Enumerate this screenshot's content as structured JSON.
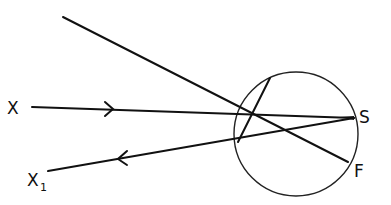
{
  "diagram": {
    "labels": {
      "x": "X",
      "x1_main": "X",
      "x1_sub": "1",
      "s": "S",
      "f": "F"
    },
    "colors": {
      "stroke": "#111111",
      "background": "#ffffff"
    },
    "geometry": {
      "circle": {
        "cx": 296,
        "cy": 134,
        "r": 62
      },
      "ray_in": {
        "from": [
          32,
          107
        ],
        "to": [
          354,
          118
        ],
        "arrow_at": [
          112,
          109
        ],
        "arrow_dir": "right"
      },
      "ray_out": {
        "from": [
          354,
          118
        ],
        "to": [
          48,
          171
        ],
        "arrow_at": [
          120,
          158
        ],
        "arrow_dir": "left"
      },
      "oblique": {
        "from": [
          63,
          17
        ],
        "to": [
          348,
          162
        ]
      },
      "chord": {
        "from": [
          270,
          78
        ],
        "to": [
          238,
          142
        ]
      }
    }
  }
}
